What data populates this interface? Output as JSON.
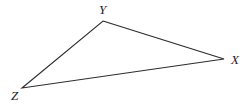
{
  "figure": {
    "name": "triangle-xyz",
    "background_color": "#ffffff",
    "stroke_color": "#2b2b2b",
    "stroke_width": 1.1,
    "width": 251,
    "height": 110
  },
  "chart_data": {
    "type": "diagram",
    "shape": "triangle",
    "title": "",
    "vertices": [
      {
        "label": "Y",
        "x": 103,
        "y": 21
      },
      {
        "label": "X",
        "x": 224,
        "y": 59
      },
      {
        "label": "Z",
        "x": 22,
        "y": 88
      }
    ],
    "edges": [
      {
        "from": "Y",
        "to": "X"
      },
      {
        "from": "X",
        "to": "Z"
      },
      {
        "from": "Z",
        "to": "Y"
      }
    ],
    "labels": {
      "Y": "Y",
      "X": "X",
      "Z": "Z"
    }
  },
  "labels": {
    "y": "Y",
    "x": "X",
    "z": "Z"
  }
}
